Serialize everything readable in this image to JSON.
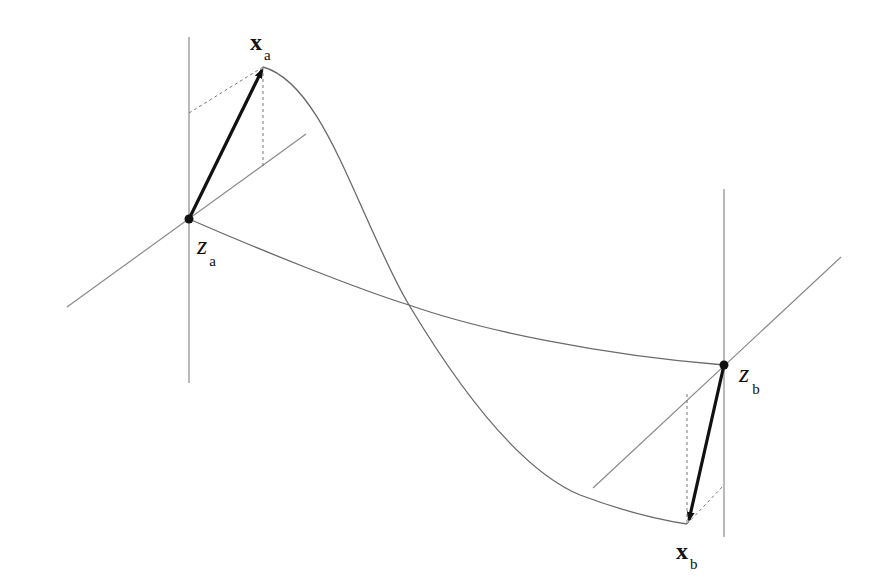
{
  "diagram": {
    "labels": {
      "xa": {
        "main": "x",
        "sub": "a"
      },
      "za": {
        "main": "z",
        "sub": "a"
      },
      "zb": {
        "main": "z",
        "sub": "b"
      },
      "xb": {
        "main": "x",
        "sub": "b"
      }
    },
    "colors": {
      "axis": "#8a8a8a",
      "curve": "#6a6a6a",
      "vector": "#111111",
      "dashed": "#777777",
      "point": "#111111"
    }
  }
}
